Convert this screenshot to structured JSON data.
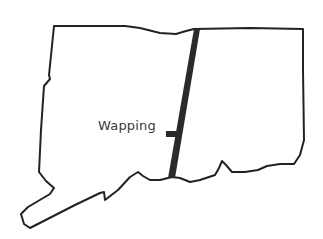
{
  "map": {
    "region": "Connecticut outline",
    "outline_color": "#222222",
    "route_color": "#2a2a2a",
    "labels": [
      {
        "text": "Wapping"
      }
    ]
  }
}
